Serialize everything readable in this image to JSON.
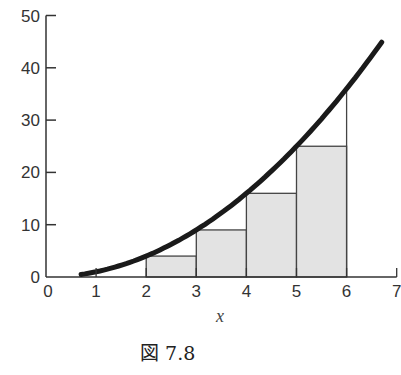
{
  "chart_data": {
    "type": "line",
    "title": "",
    "caption": "図 7.8",
    "xlabel": "x",
    "ylabel": "",
    "xlim": [
      0,
      7
    ],
    "ylim": [
      0,
      50
    ],
    "x_ticks": [
      "0",
      "1",
      "2",
      "3",
      "4",
      "5",
      "6",
      "7"
    ],
    "y_ticks": [
      "0",
      "10",
      "20",
      "30",
      "40",
      "50"
    ],
    "grid": false,
    "legend": null,
    "series": [
      {
        "name": "y = x^2",
        "type": "line",
        "x": [
          0.7,
          1,
          2,
          3,
          4,
          5,
          6,
          6.7
        ],
        "y": [
          0.49,
          1,
          4,
          9,
          16,
          25,
          36,
          44.9
        ]
      }
    ],
    "rectangles": [
      {
        "x0": 2,
        "x1": 3,
        "height": 4,
        "filled": true
      },
      {
        "x0": 3,
        "x1": 4,
        "height": 9,
        "filled": true
      },
      {
        "x0": 4,
        "x1": 5,
        "height": 16,
        "filled": true
      },
      {
        "x0": 5,
        "x1": 6,
        "height": 25,
        "filled": true
      }
    ],
    "vertical_line": {
      "x": 6,
      "y_top": 36
    }
  }
}
